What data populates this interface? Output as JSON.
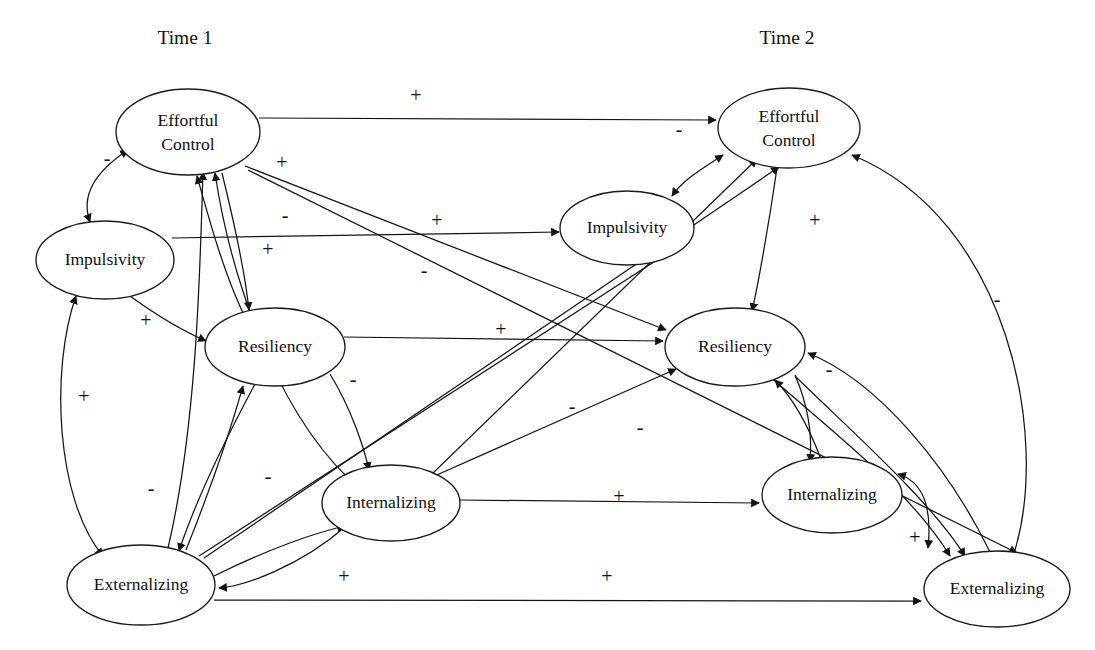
{
  "figure": {
    "type": "path-diagram",
    "width": 1095,
    "height": 650,
    "background_color": "#ffffff",
    "line_color": "#141414"
  },
  "headers": [
    {
      "id": "time1",
      "label": "Time 1",
      "x": 185,
      "y": 44
    },
    {
      "id": "time2",
      "label": "Time 2",
      "x": 787,
      "y": 44
    }
  ],
  "nodes": [
    {
      "id": "t1_ec",
      "label": "Effortful Control",
      "line1": "Effortful",
      "line2": "Control",
      "cx": 188,
      "cy": 132,
      "rx": 72,
      "ry": 43,
      "wave": "Time 1"
    },
    {
      "id": "t1_imp",
      "label": "Impulsivity",
      "line1": "Impulsivity",
      "line2": "",
      "cx": 105,
      "cy": 260,
      "rx": 69,
      "ry": 39,
      "wave": "Time 1"
    },
    {
      "id": "t1_res",
      "label": "Resiliency",
      "line1": "Resiliency",
      "line2": "",
      "cx": 275,
      "cy": 347,
      "rx": 70,
      "ry": 39,
      "wave": "Time 1"
    },
    {
      "id": "t1_int",
      "label": "Internalizing",
      "line1": "Internalizing",
      "line2": "",
      "cx": 391,
      "cy": 503,
      "rx": 69,
      "ry": 38,
      "wave": "Time 1"
    },
    {
      "id": "t1_ext",
      "label": "Externalizing",
      "line1": "Externalizing",
      "line2": "",
      "cx": 141,
      "cy": 585,
      "rx": 74,
      "ry": 40,
      "wave": "Time 1"
    },
    {
      "id": "t2_ec",
      "label": "Effortful Control",
      "line1": "Effortful",
      "line2": "Control",
      "cx": 789,
      "cy": 128,
      "rx": 71,
      "ry": 40,
      "wave": "Time 2"
    },
    {
      "id": "t2_imp",
      "label": "Impulsivity",
      "line1": "Impulsivity",
      "line2": "",
      "cx": 627,
      "cy": 228,
      "rx": 67,
      "ry": 37,
      "wave": "Time 2"
    },
    {
      "id": "t2_res",
      "label": "Resiliency",
      "line1": "Resiliency",
      "line2": "",
      "cx": 735,
      "cy": 347,
      "rx": 70,
      "ry": 39,
      "wave": "Time 2"
    },
    {
      "id": "t2_int",
      "label": "Internalizing",
      "line1": "Internalizing",
      "line2": "",
      "cx": 832,
      "cy": 495,
      "rx": 70,
      "ry": 38,
      "wave": "Time 2"
    },
    {
      "id": "t2_ext",
      "label": "Externalizing",
      "line1": "Externalizing",
      "line2": "",
      "cx": 997,
      "cy": 589,
      "rx": 73,
      "ry": 38,
      "wave": "Time 2"
    }
  ],
  "signs": [
    {
      "id": "s01",
      "text": "+",
      "x": 416,
      "y": 97,
      "for": "t1_ec -> t2_ec"
    },
    {
      "id": "s02",
      "text": "-",
      "x": 679,
      "y": 131,
      "for": "t1_ec -> t2_ec arrowhead"
    },
    {
      "id": "s03",
      "text": "-",
      "x": 107,
      "y": 160,
      "for": "t1_ec <-> t1_imp"
    },
    {
      "id": "s04",
      "text": "+",
      "x": 282,
      "y": 164,
      "for": "t1_res -> t1_ec"
    },
    {
      "id": "s05",
      "text": "-",
      "x": 285,
      "y": 217,
      "for": "t1_int -> t1_ec"
    },
    {
      "id": "s06",
      "text": "+",
      "x": 437,
      "y": 222,
      "for": "t1_imp -> t2_imp"
    },
    {
      "id": "s07",
      "text": "+",
      "x": 268,
      "y": 251,
      "for": "t1_ext -> t1_ec"
    },
    {
      "id": "s08",
      "text": "-",
      "x": 424,
      "y": 272,
      "for": "t1_ec -> t2_res"
    },
    {
      "id": "s09",
      "text": "+",
      "x": 146,
      "y": 322,
      "for": "t1_imp -> t1_res"
    },
    {
      "id": "s10",
      "text": "+",
      "x": 501,
      "y": 331,
      "for": "t1_res -> t2_res"
    },
    {
      "id": "s11",
      "text": "+",
      "x": 815,
      "y": 222,
      "for": "t2_imp <-> t2_ec"
    },
    {
      "id": "s12",
      "text": "-",
      "x": 997,
      "y": 301,
      "for": "t2_ext -> t2_ec"
    },
    {
      "id": "s13",
      "text": "-",
      "x": 353,
      "y": 381,
      "for": "t1_res -> t1_int"
    },
    {
      "id": "s14",
      "text": "-",
      "x": 572,
      "y": 408,
      "for": "t1_int -> t2_res"
    },
    {
      "id": "s15",
      "text": "-",
      "x": 829,
      "y": 371,
      "for": "t2_res -> t2_int"
    },
    {
      "id": "s16",
      "text": "-",
      "x": 640,
      "y": 429,
      "for": "t2_int -> t2_res"
    },
    {
      "id": "s17",
      "text": "+",
      "x": 84,
      "y": 398,
      "for": "t1_imp <-> t1_ext"
    },
    {
      "id": "s18",
      "text": "-",
      "x": 151,
      "y": 490,
      "for": "t1_res -> t1_ext"
    },
    {
      "id": "s19",
      "text": "-",
      "x": 268,
      "y": 478,
      "for": "t1_ext -> t1_res"
    },
    {
      "id": "s20",
      "text": "+",
      "x": 619,
      "y": 498,
      "for": "t1_int -> t2_int"
    },
    {
      "id": "s21",
      "text": "+",
      "x": 915,
      "y": 539,
      "for": "t2_int <-> t2_ext"
    },
    {
      "id": "s22",
      "text": "+",
      "x": 344,
      "y": 578,
      "for": "t1_int -> t1_ext"
    },
    {
      "id": "s23",
      "text": "+",
      "x": 607,
      "y": 578,
      "for": "t1_ext -> t2_ext"
    }
  ],
  "edges": [
    {
      "id": "e01",
      "from": "t1_ec",
      "to": "t2_ec",
      "sign": "+",
      "style": "straight-horizontal"
    },
    {
      "id": "e02",
      "from": "t1_ec",
      "to": "t1_imp",
      "sign": "-",
      "style": "curved-bidirectional"
    },
    {
      "id": "e03",
      "from": "t1_res",
      "to": "t1_ec",
      "sign": "+",
      "style": "curved"
    },
    {
      "id": "e04",
      "from": "t1_int",
      "to": "t1_ec",
      "sign": "-",
      "style": "curved"
    },
    {
      "id": "e05",
      "from": "t1_ext",
      "to": "t1_ec",
      "sign": "+",
      "style": "curved"
    },
    {
      "id": "e06",
      "from": "t1_imp",
      "to": "t2_imp",
      "sign": "+",
      "style": "straight-horizontal"
    },
    {
      "id": "e07",
      "from": "t1_ec",
      "to": "t2_res",
      "sign": "-",
      "style": "straight"
    },
    {
      "id": "e08",
      "from": "t1_ec",
      "to": "t2_ext",
      "sign": "-",
      "style": "straight"
    },
    {
      "id": "e09",
      "from": "t1_imp",
      "to": "t1_res",
      "sign": "+",
      "style": "curved"
    },
    {
      "id": "e10",
      "from": "t1_res",
      "to": "t2_res",
      "sign": "+",
      "style": "straight-horizontal"
    },
    {
      "id": "e11",
      "from": "t2_imp",
      "to": "t2_ec",
      "sign": "+",
      "style": "curved-bidirectional"
    },
    {
      "id": "e12",
      "from": "t2_ext",
      "to": "t2_ec",
      "sign": "-",
      "style": "curved"
    },
    {
      "id": "e13",
      "from": "t1_res",
      "to": "t1_int",
      "sign": "-",
      "style": "curved"
    },
    {
      "id": "e14",
      "from": "t1_int",
      "to": "t2_res",
      "sign": "-",
      "style": "straight"
    },
    {
      "id": "e15",
      "from": "t2_res",
      "to": "t2_int",
      "sign": "-",
      "style": "curved"
    },
    {
      "id": "e16",
      "from": "t2_int",
      "to": "t2_res",
      "sign": "-",
      "style": "curved"
    },
    {
      "id": "e17",
      "from": "t1_imp",
      "to": "t1_ext",
      "sign": "+",
      "style": "curved-bidirectional"
    },
    {
      "id": "e18",
      "from": "t1_res",
      "to": "t1_ext",
      "sign": "-",
      "style": "curved"
    },
    {
      "id": "e19",
      "from": "t1_ext",
      "to": "t1_res",
      "sign": "-",
      "style": "curved"
    },
    {
      "id": "e20",
      "from": "t1_int",
      "to": "t2_int",
      "sign": "+",
      "style": "straight-horizontal"
    },
    {
      "id": "e21",
      "from": "t2_int",
      "to": "t2_ext",
      "sign": "+",
      "style": "curved-bidirectional"
    },
    {
      "id": "e22",
      "from": "t1_int",
      "to": "t1_ext",
      "sign": "+",
      "style": "curved"
    },
    {
      "id": "e23",
      "from": "t1_ext",
      "to": "t2_ext",
      "sign": "+",
      "style": "straight-horizontal"
    },
    {
      "id": "e24",
      "from": "t1_ext",
      "to": "t2_ec",
      "sign": "",
      "style": "straight"
    },
    {
      "id": "e25",
      "from": "t1_int",
      "to": "t2_ec",
      "sign": "",
      "style": "straight"
    },
    {
      "id": "e26",
      "from": "t1_ext",
      "to": "t2_imp",
      "sign": "",
      "style": "straight"
    },
    {
      "id": "e27",
      "from": "t2_res",
      "to": "t2_ext",
      "sign": "",
      "style": "curved"
    },
    {
      "id": "e28",
      "from": "t2_ec",
      "to": "t2_ext",
      "sign": "",
      "style": "curved"
    }
  ]
}
